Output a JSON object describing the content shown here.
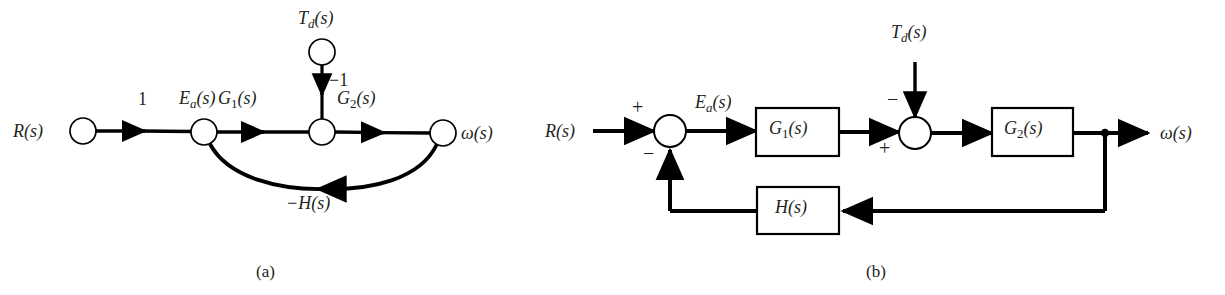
{
  "figure": {
    "type": "control-system-block-diagram",
    "background": "#ffffff",
    "line_color": "#000000",
    "text_color": "#231f20"
  },
  "panel_a": {
    "caption": "(a)",
    "kind": "signal-flow-graph",
    "nodes": [
      {
        "id": "R",
        "label": "R(s)",
        "cx": 83,
        "cy": 131,
        "r": 13,
        "label_x": 30,
        "label_y": 131,
        "label_side": "left"
      },
      {
        "id": "Ea",
        "label": "Ea(s)",
        "cx": 204,
        "cy": 132,
        "r": 13,
        "label_x": 204,
        "label_y": 103,
        "label_side": "above"
      },
      {
        "id": "Sum",
        "label": "",
        "cx": 322,
        "cy": 132,
        "r": 13,
        "label_x": 0,
        "label_y": 0,
        "label_side": "none"
      },
      {
        "id": "Td",
        "label": "Td(s)",
        "cx": 322,
        "cy": 52,
        "r": 13,
        "label_x": 322,
        "label_y": 22,
        "label_side": "above"
      },
      {
        "id": "w",
        "label": "w(s)",
        "cx": 443,
        "cy": 133,
        "r": 13,
        "label_x": 489,
        "label_y": 133,
        "label_side": "right"
      }
    ],
    "node_labels": {
      "R": "R(s)",
      "Ea_main": "E",
      "Ea_sub": "a",
      "Ea_tail": "(s)",
      "Td_main": "T",
      "Td_sub": "d",
      "Td_tail": "(s)",
      "omega": "ω(s)"
    },
    "branch_gains": [
      {
        "id": "gain-unity",
        "text": "1",
        "x": 143,
        "y": 104
      },
      {
        "id": "gain-G1",
        "main": "G",
        "sub": "1",
        "tail": "(s)",
        "x": 238,
        "y": 103
      },
      {
        "id": "gain-G2",
        "main": "G",
        "sub": "2",
        "tail": "(s)",
        "x": 357,
        "y": 103
      },
      {
        "id": "gain-minus1",
        "text": "−1",
        "x": 334,
        "y": 81
      },
      {
        "id": "gain-minusH",
        "text": "−H(s)",
        "x": 292,
        "y": 197
      }
    ]
  },
  "panel_b": {
    "caption": "(b)",
    "kind": "block-diagram",
    "input_label": "R(s)",
    "output_label": "ω(s)",
    "disturbance_label_main": "T",
    "disturbance_label_sub": "d",
    "disturbance_label_tail": "(s)",
    "error_label_main": "E",
    "error_label_sub": "a",
    "error_label_tail": "(s)",
    "blocks": [
      {
        "id": "block-G1",
        "main": "G",
        "sub": "1",
        "tail": "(s)",
        "x": 756,
        "y": 108,
        "w": 83,
        "h": 48
      },
      {
        "id": "block-G2",
        "main": "G",
        "sub": "2",
        "tail": "(s)",
        "x": 992,
        "y": 108,
        "w": 81,
        "h": 48
      },
      {
        "id": "block-H",
        "main": "H",
        "sub": "",
        "tail": "(s)",
        "x": 757,
        "y": 187,
        "w": 82,
        "h": 47
      }
    ],
    "summers": [
      {
        "id": "summer-1",
        "cx": 670,
        "cy": 131,
        "r": 16,
        "signs": [
          {
            "text": "+",
            "x": 637,
            "y": 106
          },
          {
            "text": "−",
            "x": 648,
            "y": 152
          }
        ]
      },
      {
        "id": "summer-2",
        "cx": 915,
        "cy": 133,
        "r": 16,
        "signs": [
          {
            "text": "−",
            "x": 892,
            "y": 100
          },
          {
            "text": "+",
            "x": 884,
            "y": 147
          }
        ]
      }
    ],
    "branch_point": {
      "cx": 1105,
      "cy": 133,
      "r": 4
    }
  }
}
